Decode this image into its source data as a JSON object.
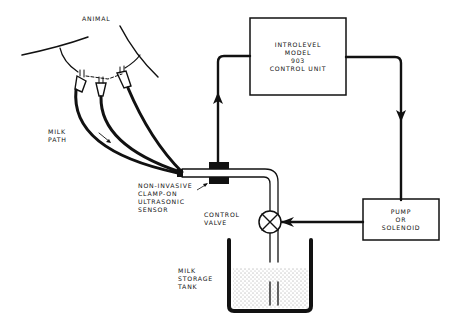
{
  "labels": {
    "animal": "ANIMAL",
    "milk_path": [
      "MILK",
      "PATH"
    ],
    "sensor": [
      "NON-INVASIVE",
      "CLAMP-ON",
      "ULTRASONIC",
      "SENSOR"
    ],
    "control_valve": [
      "CONTROL",
      "VALVE"
    ],
    "tank": [
      "MILK",
      "STORAGE",
      "TANK"
    ],
    "control_unit": [
      "INTROLEVEL",
      "MODEL",
      "903",
      "CONTROL UNIT"
    ],
    "pump": [
      "PUMP",
      "OR",
      "SOLENOID"
    ]
  },
  "colors": {
    "ink": "#111111",
    "background": "#ffffff"
  }
}
